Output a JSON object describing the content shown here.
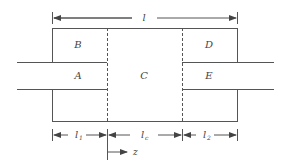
{
  "diagram": {
    "type": "expansion-chamber-muffler",
    "regions": {
      "A": "A",
      "B": "B",
      "C": "C",
      "D": "D",
      "E": "E"
    },
    "dimensions": {
      "total": "l",
      "left": "l",
      "left_sub": "1",
      "center": "l",
      "center_sub": "c",
      "right": "l",
      "right_sub": "2",
      "axis": "z"
    },
    "colors": {
      "line": "#555555",
      "text": "#444444",
      "background": "#ffffff"
    }
  }
}
